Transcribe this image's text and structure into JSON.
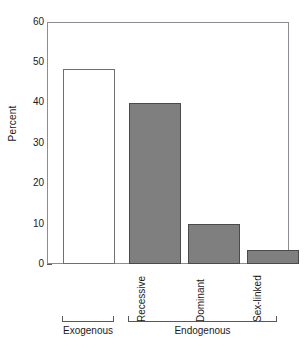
{
  "chart_data": {
    "type": "bar",
    "title": "",
    "subtitle": "",
    "xlabel": "",
    "ylabel": "Percent",
    "ylim": [
      0,
      60
    ],
    "yticks": [
      0,
      10,
      20,
      30,
      40,
      50,
      60
    ],
    "ytick_labels": [
      "0",
      "10",
      "20",
      "30",
      "40",
      "50",
      "60"
    ],
    "grid": false,
    "legend": null,
    "categories": [
      "Exogenous",
      "Recessive",
      "Dominant",
      "Sex-linked"
    ],
    "values": [
      48.5,
      40.0,
      10.0,
      3.5
    ],
    "bar_styles": [
      "open",
      "filled",
      "filled",
      "filled"
    ],
    "colors": {
      "bar_fill": "#7f7f7f",
      "bar_edge": "#4a4a4a",
      "open_bar_fill": "#ffffff",
      "open_bar_edge": "#6d6f72",
      "axis": "#8a8d91",
      "text": "#1a1a1a",
      "background": "#ffffff"
    },
    "groups": [
      {
        "label": "Exogenous",
        "categories": [
          "Exogenous"
        ]
      },
      {
        "label": "Endogenous",
        "categories": [
          "Recessive",
          "Dominant",
          "Sex-linked"
        ]
      }
    ],
    "annotations": []
  },
  "axis": {
    "y_title": "Percent",
    "ticks": [
      {
        "value": 60,
        "label": "60"
      },
      {
        "value": 50,
        "label": "50"
      },
      {
        "value": 40,
        "label": "40"
      },
      {
        "value": 30,
        "label": "30"
      },
      {
        "value": 20,
        "label": "20"
      },
      {
        "value": 10,
        "label": "10"
      },
      {
        "value": 0,
        "label": "0"
      }
    ]
  },
  "category_labels": [
    {
      "text": "Recessive"
    },
    {
      "text": "Dominant"
    },
    {
      "text": "Sex-linked"
    }
  ],
  "group_labels": [
    {
      "text": "Exogenous"
    },
    {
      "text": "Endogenous"
    }
  ]
}
